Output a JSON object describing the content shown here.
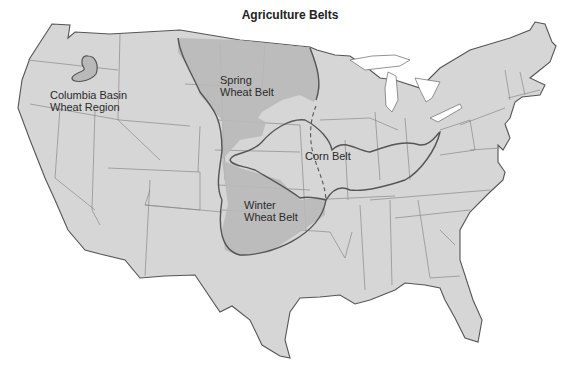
{
  "title": "Agriculture Belts",
  "colors": {
    "land": "#d6d6d6",
    "belt_fill": "#b9b9b9",
    "coast": "#555555",
    "state_border": "#8a8a8a"
  },
  "regions": [
    {
      "id": "columbia",
      "label_line1": "Columbia Basin",
      "label_line2": "Wheat Region"
    },
    {
      "id": "spring",
      "label_line1": "Spring",
      "label_line2": "Wheat Belt"
    },
    {
      "id": "corn",
      "label_line1": "Corn Belt"
    },
    {
      "id": "winter",
      "label_line1": "Winter",
      "label_line2": "Wheat Belt"
    }
  ]
}
